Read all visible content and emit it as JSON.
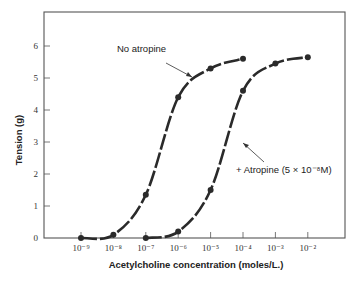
{
  "chart_data": {
    "type": "line",
    "title": "",
    "xlabel": "Acetylcholine concentration (moles/L.)",
    "ylabel": "Tension (g)",
    "x_scale": "log",
    "x_ticks": [
      "10⁻⁹",
      "10⁻⁸",
      "10⁻⁷",
      "10⁻⁶",
      "10⁻⁵",
      "10⁻⁴",
      "10⁻³",
      "10⁻²"
    ],
    "x_exponents": [
      -9,
      -8,
      -7,
      -6,
      -5,
      -4,
      -3,
      -2
    ],
    "y_ticks": [
      "0",
      "1",
      "2",
      "3",
      "4",
      "5",
      "6"
    ],
    "ylim": [
      0,
      7
    ],
    "grid": false,
    "series": [
      {
        "name": "No atropine",
        "x_exponents": [
          -9,
          -8,
          -7,
          -6,
          -5,
          -4
        ],
        "values": [
          0.0,
          0.1,
          1.35,
          4.4,
          5.3,
          5.6
        ]
      },
      {
        "name": "+ Atropine (5 × 10⁻⁸M)",
        "x_exponents": [
          -7,
          -6,
          -5,
          -4,
          -3,
          -2
        ],
        "values": [
          0.0,
          0.2,
          1.5,
          4.6,
          5.45,
          5.65
        ]
      }
    ],
    "annotations": [
      "No atropine",
      "+ Atropine (5 × 10⁻⁸M)"
    ]
  },
  "labels": {
    "xlabel": "Acetylcholine concentration (moles/L.)",
    "ylabel": "Tension (g)",
    "annot_no_atropine": "No atropine",
    "annot_atropine": "+ Atropine (5 × 10⁻⁸M)"
  },
  "colors": {
    "curve": "#2a2a2a",
    "axis": "#555555"
  }
}
